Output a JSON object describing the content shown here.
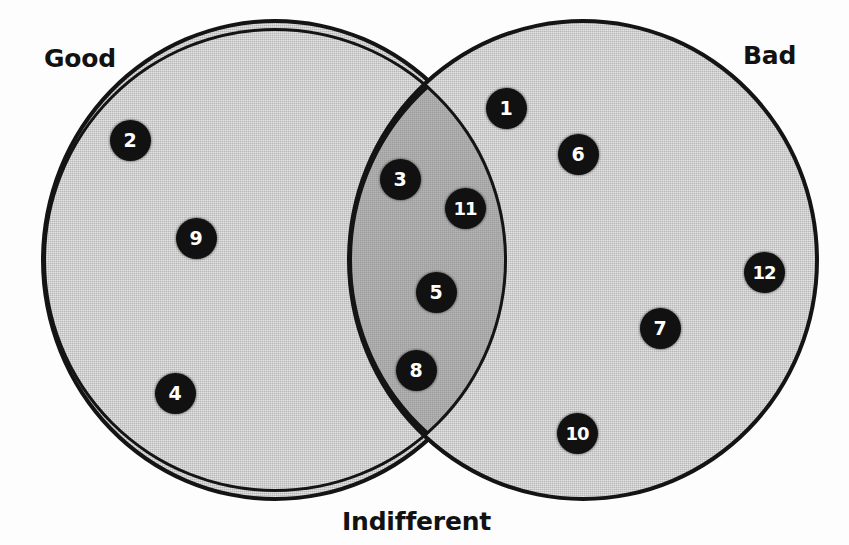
{
  "figure": {
    "type": "venn-diagram",
    "width": 849,
    "height": 545,
    "background_color": "#ffffff",
    "frame_color": "#1a1a1a"
  },
  "sets": [
    {
      "id": "good",
      "label": "Good",
      "label_position": "top-left",
      "fill_color": "#c9c9c9",
      "outline_color": "#141414",
      "circle": {
        "cx": 275,
        "cy": 260,
        "r": 234
      }
    },
    {
      "id": "bad",
      "label": "Bad",
      "label_position": "top-right",
      "fill_color": "#c9c9c9",
      "outline_color": "#141414",
      "circle": {
        "cx": 583,
        "cy": 260,
        "r": 236
      }
    },
    {
      "id": "indifferent",
      "label": "Indifferent",
      "label_position": "bottom-center",
      "fill_color": "#fdfdfd",
      "outline_color": "#141414",
      "circle": null
    }
  ],
  "intersection": {
    "label": "Good ∩ Bad",
    "fill_color": "#a9a9a9"
  },
  "markers": [
    {
      "id": "1",
      "label": "1",
      "region": "bad",
      "x": 506,
      "y": 108
    },
    {
      "id": "2",
      "label": "2",
      "region": "good",
      "x": 130,
      "y": 140
    },
    {
      "id": "3",
      "label": "3",
      "region": "intersection",
      "x": 400,
      "y": 179
    },
    {
      "id": "4",
      "label": "4",
      "region": "good",
      "x": 175,
      "y": 393
    },
    {
      "id": "5",
      "label": "5",
      "region": "intersection",
      "x": 436,
      "y": 292
    },
    {
      "id": "6",
      "label": "6",
      "region": "bad",
      "x": 578,
      "y": 154
    },
    {
      "id": "7",
      "label": "7",
      "region": "bad",
      "x": 660,
      "y": 328
    },
    {
      "id": "8",
      "label": "8",
      "region": "intersection",
      "x": 416,
      "y": 370
    },
    {
      "id": "9",
      "label": "9",
      "region": "good",
      "x": 196,
      "y": 238
    },
    {
      "id": "10",
      "label": "10",
      "region": "bad",
      "x": 577,
      "y": 433
    },
    {
      "id": "11",
      "label": "11",
      "region": "intersection",
      "x": 465,
      "y": 208
    },
    {
      "id": "12",
      "label": "12",
      "region": "bad",
      "x": 764,
      "y": 272
    }
  ]
}
